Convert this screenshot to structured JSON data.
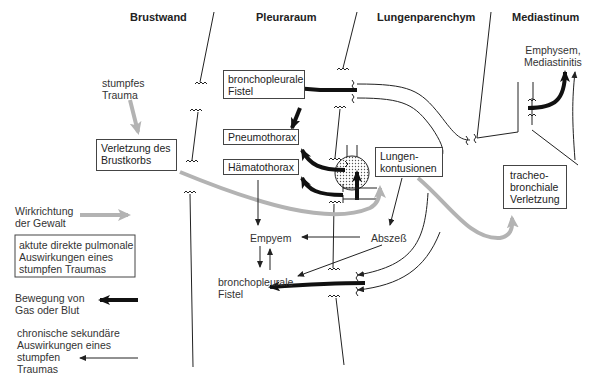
{
  "columns": {
    "chest_wall": "Brustwand",
    "pleural_space": "Pleuraraum",
    "lung_parenchyma": "Lungenparenchym",
    "mediastinum": "Mediastinum"
  },
  "nodes": {
    "blunt_trauma": "stumpfes\nTrauma",
    "chest_wall_injury": "Verletzung des\nBrustkorbs",
    "bronchopleural_fistula_top": "bronchopleurale\nFistel",
    "pneumothorax": "Pneumothorax",
    "hemothorax": "Hämatothorax",
    "lung_contusions": "Lungen-\nkontusionen",
    "emphysema": "Emphysem,\nMediastinitis",
    "tracheobronchial_injury": "tracheo-\nbronchiale\nVerletzung",
    "empyema": "Empyem",
    "abscess": "Abszeß",
    "bronchopleural_fistula_bottom": "bronchopleurale\nFistel"
  },
  "legend": {
    "force_direction": "Wirkrichtung\nder Gewalt",
    "acute_effects": "aktute direkte pulmonale\nAuswirkungen eines\nstumpfen Traumas",
    "gas_blood_movement": "Bewegung von\nGas oder Blut",
    "chronic_effects": "chronische sekundäre\nAuswirkungen eines\nstumpfen\nTraumas"
  },
  "colors": {
    "force_arrow": "#b3b3b3",
    "movement_arrow": "#111111",
    "line": "#222222",
    "box_border": "#444444"
  }
}
